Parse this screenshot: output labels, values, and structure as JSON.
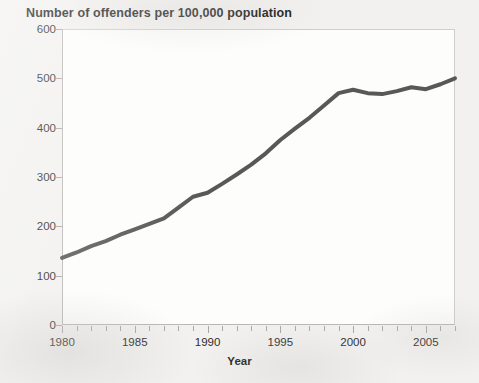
{
  "chart_data": {
    "type": "line",
    "title": "Number of offenders per 100,000 population",
    "subtitle": "",
    "xlabel": "Year",
    "ylabel": "",
    "xlim": [
      1980,
      2007
    ],
    "ylim": [
      0,
      600
    ],
    "y_ticks": [
      0,
      100,
      200,
      300,
      400,
      500,
      600
    ],
    "y_tick_labels": [
      "0",
      "100",
      "200",
      "300",
      "400",
      "500",
      "600"
    ],
    "x_ticks": [
      1980,
      1981,
      1982,
      1983,
      1984,
      1985,
      1986,
      1987,
      1988,
      1989,
      1990,
      1991,
      1992,
      1993,
      1994,
      1995,
      1996,
      1997,
      1998,
      1999,
      2000,
      2001,
      2002,
      2003,
      2004,
      2005,
      2006,
      2007
    ],
    "x_tick_labels": [
      "1980",
      "1985",
      "1990",
      "1995",
      "2000",
      "2005"
    ],
    "x_major_ticks": [
      1980,
      1985,
      1990,
      1995,
      2000,
      2005
    ],
    "grid": false,
    "legend": "none",
    "series": [
      {
        "name": "Offenders per 100,000 population",
        "color": "#585856",
        "line_width": 4,
        "x": [
          1980,
          1981,
          1982,
          1983,
          1984,
          1985,
          1986,
          1987,
          1988,
          1989,
          1990,
          1991,
          1992,
          1993,
          1994,
          1995,
          1996,
          1997,
          1998,
          1999,
          2000,
          2001,
          2002,
          2003,
          2004,
          2005,
          2006,
          2007
        ],
        "values": [
          136,
          147,
          160,
          170,
          183,
          194,
          205,
          216,
          238,
          260,
          268,
          286,
          305,
          325,
          348,
          375,
          398,
          420,
          445,
          470,
          477,
          470,
          468,
          474,
          482,
          478,
          488,
          500
        ]
      }
    ]
  },
  "axis": {
    "y_label_color": "#2b2b2b",
    "x_label_color": "#2b2b2b",
    "tick_color": "#a9a8a5",
    "frame_color": "#b9b8b5",
    "plot_background": "#fdfdfc"
  },
  "page": {
    "background": "#f2f1ef"
  }
}
